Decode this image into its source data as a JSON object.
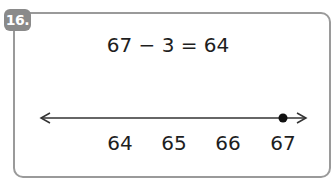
{
  "question": {
    "number": "16.",
    "equation": "67 − 3 = 64"
  },
  "number_line": {
    "labels": [
      "64",
      "65",
      "66",
      "67"
    ],
    "label_x": [
      120,
      174,
      228,
      283
    ],
    "marked_value": "67",
    "marked_x": 283
  }
}
